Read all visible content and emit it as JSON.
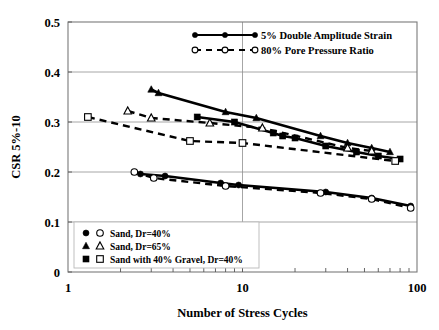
{
  "chart_data": {
    "type": "line",
    "title": "",
    "xlabel": "Number of Stress Cycles",
    "ylabel": "CSR 5%-10",
    "xscale": "log",
    "xlim": [
      1,
      100
    ],
    "ylim": [
      0,
      0.5
    ],
    "xticks": [
      "1",
      "10",
      "100"
    ],
    "yticks": [
      "0",
      "0.1",
      "0.2",
      "0.3",
      "0.4",
      "0.5"
    ],
    "grid": true,
    "legend_position": "top-center and inside-bottom-left",
    "line_type_legend": [
      {
        "label": "5% Double Amplitude Strain",
        "style": "solid",
        "marker": "filled-circle"
      },
      {
        "label": "80% Pore Pressure Ratio",
        "style": "dashed",
        "marker": "open-circle"
      }
    ],
    "material_legend": [
      {
        "label": "Sand, Dr=40%",
        "marker_filled": "circle",
        "marker_open": "circle"
      },
      {
        "label": "Sand, Dr=65%",
        "marker_filled": "triangle",
        "marker_open": "triangle"
      },
      {
        "label": "Sand with 40% Gravel, Dr=40%",
        "marker_filled": "square",
        "marker_open": "square"
      }
    ],
    "series": [
      {
        "name": "Sand, Dr=65% - 5% Double Amplitude Strain",
        "material": "Sand, Dr=65%",
        "criterion": "5% Double Amplitude Strain",
        "style": "solid",
        "marker": "filled-triangle",
        "x": [
          3.0,
          3.3,
          8.0,
          12.0,
          28.0,
          40.0,
          55.0,
          70.0
        ],
        "y": [
          0.365,
          0.358,
          0.32,
          0.308,
          0.272,
          0.258,
          0.248,
          0.24
        ]
      },
      {
        "name": "Sand with 40% Gravel, Dr=40% - 5% Double Amplitude Strain",
        "material": "Sand with 40% Gravel, Dr=40%",
        "criterion": "5% Double Amplitude Strain",
        "style": "solid",
        "marker": "filled-square",
        "x": [
          5.5,
          9.0,
          15.0,
          17.0,
          20.0,
          30.0,
          45.0,
          60.0,
          80.0
        ],
        "y": [
          0.31,
          0.3,
          0.278,
          0.272,
          0.268,
          0.252,
          0.24,
          0.232,
          0.226
        ]
      },
      {
        "name": "Sand, Dr=65% - 80% Pore Pressure Ratio",
        "material": "Sand, Dr=65%",
        "criterion": "80% Pore Pressure Ratio",
        "style": "dashed",
        "marker": "open-triangle",
        "x": [
          2.2,
          3.0,
          6.5,
          13.0,
          40.0,
          55.0
        ],
        "y": [
          0.322,
          0.308,
          0.298,
          0.288,
          0.248,
          0.242
        ]
      },
      {
        "name": "Sand with 40% Gravel, Dr=40% - 80% Pore Pressure Ratio",
        "material": "Sand with 40% Gravel, Dr=40%",
        "criterion": "80% Pore Pressure Ratio",
        "style": "dashed",
        "marker": "open-square",
        "x": [
          1.3,
          5.0,
          10.0,
          75.0
        ],
        "y": [
          0.31,
          0.262,
          0.258,
          0.222
        ]
      },
      {
        "name": "Sand, Dr=40% - 5% Double Amplitude Strain",
        "material": "Sand, Dr=40%",
        "criterion": "5% Double Amplitude Strain",
        "style": "solid",
        "marker": "filled-circle",
        "x": [
          2.6,
          3.6,
          7.5,
          9.5,
          30.0,
          55.0,
          92.0
        ],
        "y": [
          0.196,
          0.192,
          0.178,
          0.174,
          0.16,
          0.148,
          0.132
        ]
      },
      {
        "name": "Sand, Dr=40% - 80% Pore Pressure Ratio",
        "material": "Sand, Dr=40%",
        "criterion": "80% Pore Pressure Ratio",
        "style": "dashed",
        "marker": "open-circle",
        "x": [
          2.4,
          3.1,
          8.0,
          28.0,
          55.0,
          92.0
        ],
        "y": [
          0.2,
          0.188,
          0.172,
          0.158,
          0.146,
          0.128
        ]
      }
    ]
  }
}
